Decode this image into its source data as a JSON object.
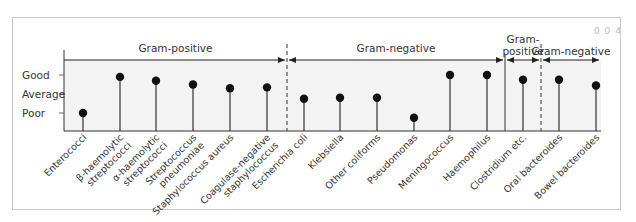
{
  "page": {
    "corner_mark": "0 0 4",
    "y_levels": [
      "Good",
      "Average",
      "Poor"
    ]
  },
  "groups": [
    {
      "label": "Gram-positive",
      "label_line2": ""
    },
    {
      "label": "Gram-negative",
      "label_line2": ""
    },
    {
      "label": "Gram-",
      "label_line2": "positive"
    },
    {
      "label": "Gram-negative",
      "label_line2": ""
    }
  ],
  "colors": {
    "plot_bg": "#f3f3f3",
    "line": "#333333",
    "dot": "#111111",
    "frame": "#c8c8c8"
  },
  "chart_data": {
    "type": "scatter",
    "subtype": "lollipop",
    "title": "",
    "xlabel": "",
    "ylabel": "",
    "y_ticks": [
      "Poor",
      "Average",
      "Good"
    ],
    "y_scale_note": "Poor=1, Average=2, Good=3 (ordinal)",
    "ylim": [
      0,
      3.4
    ],
    "grid": false,
    "legend": null,
    "groups": [
      {
        "name": "Gram-positive",
        "categories": [
          "Enterococci",
          "β-haemolytic streptococci",
          "α-haemolytic streptococci",
          "Streptococcus pneumoniae",
          "Staphylococcus aureus",
          "Coagulase-negative staphylococcus"
        ]
      },
      {
        "name": "Gram-negative",
        "categories": [
          "Escherichia coli",
          "Klebsiella",
          "Other coliforms",
          "Pseudomonas",
          "Meningococcus",
          "Haemophilus"
        ]
      },
      {
        "name": "Gram-positive",
        "categories": [
          "Clostridium etc."
        ]
      },
      {
        "name": "Gram-negative",
        "categories": [
          "Oral bacteroides",
          "Bowel bacteroides"
        ]
      }
    ],
    "categories": [
      "Enterococci",
      "β-haemolytic streptococci",
      "α-haemolytic streptococci",
      "Streptococcus pneumoniae",
      "Staphylococcus aureus",
      "Coagulase-negative staphylococcus",
      "Escherichia coli",
      "Klebsiella",
      "Other coliforms",
      "Pseudomonas",
      "Meningococcus",
      "Haemophilus",
      "Clostridium etc.",
      "Oral bacteroides",
      "Bowel bacteroides"
    ],
    "values": [
      1.0,
      2.9,
      2.7,
      2.5,
      2.3,
      2.35,
      1.75,
      1.8,
      1.8,
      0.75,
      3.0,
      3.0,
      2.75,
      2.75,
      2.45
    ]
  },
  "x_labels": [
    {
      "l1": "Enterococci",
      "l2": ""
    },
    {
      "l1": "β-haemolytic",
      "l2": "streptococci"
    },
    {
      "l1": "α-haemolytic",
      "l2": "streptococci"
    },
    {
      "l1": "Streptococcus",
      "l2": "pneumoniae"
    },
    {
      "l1": "Staphylococcus aureus",
      "l2": ""
    },
    {
      "l1": "Coagulase-negative",
      "l2": "staphylococcus"
    },
    {
      "l1": "Escherichia coli",
      "l2": ""
    },
    {
      "l1": "Klebsiella",
      "l2": ""
    },
    {
      "l1": "Other coliforms",
      "l2": ""
    },
    {
      "l1": "Pseudomonas",
      "l2": ""
    },
    {
      "l1": "Meningococcus",
      "l2": ""
    },
    {
      "l1": "Haemophilus",
      "l2": ""
    },
    {
      "l1": "Clostridium etc.",
      "l2": ""
    },
    {
      "l1": "Oral bacteroides",
      "l2": ""
    },
    {
      "l1": "Bowel bacteroides",
      "l2": ""
    }
  ]
}
